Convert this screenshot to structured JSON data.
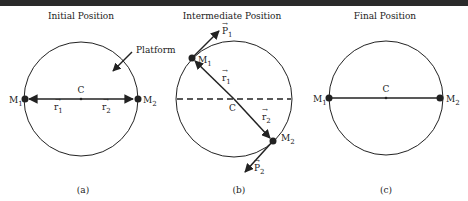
{
  "figure": {
    "panels": [
      {
        "id": "a",
        "title": "Initial Position",
        "caption": "(a)",
        "center_label": "C",
        "annotation": "Platform",
        "masses": [
          {
            "label": "M",
            "sub": "1"
          },
          {
            "label": "M",
            "sub": "2"
          }
        ],
        "vectors": [
          {
            "label": "r",
            "sub": "1"
          },
          {
            "label": "r",
            "sub": "2"
          }
        ]
      },
      {
        "id": "b",
        "title": "Intermediate Position",
        "caption": "(b)",
        "center_label": "C",
        "masses": [
          {
            "label": "M",
            "sub": "1"
          },
          {
            "label": "M",
            "sub": "2"
          }
        ],
        "vectors": [
          {
            "label": "r",
            "sub": "1"
          },
          {
            "label": "r",
            "sub": "2"
          }
        ],
        "momenta": [
          {
            "label": "P",
            "sub": "1"
          },
          {
            "label": "P",
            "sub": "2"
          }
        ]
      },
      {
        "id": "c",
        "title": "Final Position",
        "caption": "(c)",
        "center_label": "C",
        "masses": [
          {
            "label": "M",
            "sub": "1"
          },
          {
            "label": "M",
            "sub": "2"
          }
        ]
      }
    ]
  }
}
